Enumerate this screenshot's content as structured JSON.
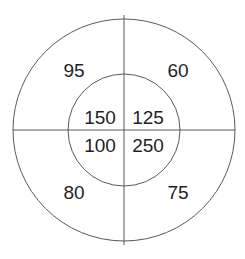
{
  "diagram": {
    "colors": {
      "stroke": "#595959",
      "text": "#1f1f1f",
      "background": "#ffffff"
    },
    "geometry": {
      "center_x": 124,
      "center_y": 130,
      "outer_radius": 111,
      "inner_radius": 56,
      "vertical_line_top_y": 15,
      "vertical_line_bottom_y": 245,
      "horizontal_line_left_x": 13,
      "horizontal_line_right_x": 235
    },
    "outer_ring": {
      "name": "outer-ring",
      "quadrants": [
        {
          "position": "top-left",
          "value": "95",
          "x": 74,
          "y": 70
        },
        {
          "position": "top-right",
          "value": "60",
          "x": 178,
          "y": 70
        },
        {
          "position": "bottom-left",
          "value": "80",
          "x": 74,
          "y": 192
        },
        {
          "position": "bottom-right",
          "value": "75",
          "x": 178,
          "y": 192
        }
      ]
    },
    "inner_circle": {
      "name": "inner-circle",
      "quadrants": [
        {
          "position": "top-left",
          "value": "150",
          "x": 100,
          "y": 117
        },
        {
          "position": "top-right",
          "value": "125",
          "x": 148,
          "y": 117
        },
        {
          "position": "bottom-left",
          "value": "100",
          "x": 100,
          "y": 145
        },
        {
          "position": "bottom-right",
          "value": "250",
          "x": 148,
          "y": 145
        }
      ]
    }
  }
}
